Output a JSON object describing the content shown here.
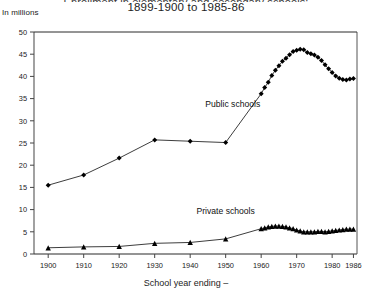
{
  "header": {
    "title_line1": "Enrollment in elementary and secondary schools:",
    "title_line2": "1899-1900 to 1985-86",
    "unit_label": "In millions",
    "xaxis_title": "School year ending –"
  },
  "chart_data": {
    "type": "line",
    "title": "1899-1900 to 1985-86",
    "xlabel": "School year ending –",
    "ylabel": "In millions",
    "xlim": [
      1896,
      1987
    ],
    "ylim": [
      0,
      50
    ],
    "ytick_step": 5,
    "grid": false,
    "legend": "inline-annotation",
    "ytick_labels": [
      "0",
      "5",
      "10",
      "15",
      "20",
      "25",
      "30",
      "35",
      "40",
      "45",
      "50"
    ],
    "ytick_values": [
      0,
      5,
      10,
      15,
      20,
      25,
      30,
      35,
      40,
      45,
      50
    ],
    "xtick_labels": [
      "1900",
      "1910",
      "1920",
      "1930",
      "1940",
      "1950",
      "1960",
      "1970",
      "1980",
      "1986"
    ],
    "xtick_values": [
      1900,
      1910,
      1920,
      1930,
      1940,
      1950,
      1960,
      1970,
      1980,
      1986
    ],
    "series": [
      {
        "name": "Public schools",
        "marker": "diamond",
        "label_x": 1952,
        "label_y": 33.2,
        "x": [
          1900,
          1910,
          1920,
          1930,
          1940,
          1950,
          1960,
          1961,
          1962,
          1963,
          1964,
          1965,
          1966,
          1967,
          1968,
          1969,
          1970,
          1971,
          1972,
          1973,
          1974,
          1975,
          1976,
          1977,
          1978,
          1979,
          1980,
          1981,
          1982,
          1983,
          1984,
          1985,
          1986
        ],
        "values": [
          15.5,
          17.8,
          21.6,
          25.7,
          25.4,
          25.1,
          36.1,
          37.5,
          38.7,
          40.2,
          41.4,
          42.4,
          43.4,
          44.1,
          44.9,
          45.6,
          45.9,
          46.1,
          46.0,
          45.4,
          45.1,
          44.8,
          44.3,
          43.6,
          42.6,
          41.7,
          40.9,
          40.1,
          39.6,
          39.3,
          39.2,
          39.4,
          39.5
        ]
      },
      {
        "name": "Private schools",
        "marker": "triangle",
        "label_x": 1950,
        "label_y": 9.0,
        "x": [
          1900,
          1910,
          1920,
          1930,
          1940,
          1950,
          1960,
          1961,
          1962,
          1963,
          1964,
          1965,
          1966,
          1967,
          1968,
          1969,
          1970,
          1971,
          1972,
          1973,
          1974,
          1975,
          1976,
          1977,
          1978,
          1979,
          1980,
          1981,
          1982,
          1983,
          1984,
          1985,
          1986
        ],
        "values": [
          1.4,
          1.6,
          1.7,
          2.4,
          2.6,
          3.4,
          5.7,
          5.9,
          6.1,
          6.2,
          6.3,
          6.3,
          6.2,
          6.1,
          5.9,
          5.7,
          5.4,
          5.2,
          5.0,
          5.0,
          5.0,
          5.0,
          5.1,
          5.1,
          5.0,
          5.1,
          5.2,
          5.3,
          5.4,
          5.5,
          5.6,
          5.6,
          5.6
        ]
      }
    ]
  }
}
